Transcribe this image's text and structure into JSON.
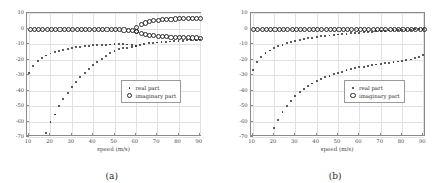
{
  "figure": {
    "panels": [
      {
        "caption": "(a)",
        "legend": {
          "real": "real part",
          "imaginary": "imaginary part"
        },
        "chart_data": {
          "type": "scatter",
          "title": "",
          "xlabel": "speed (m/s)",
          "ylabel": "",
          "xlim": [
            9,
            91
          ],
          "ylim": [
            -70,
            10
          ],
          "xticks": [
            10,
            20,
            30,
            40,
            50,
            60,
            70,
            80,
            90
          ],
          "yticks": [
            10,
            0,
            -10,
            -20,
            -30,
            -40,
            -50,
            -60,
            -70
          ],
          "grid": true,
          "legend_position": "center-right",
          "series": [
            {
              "name": "real part",
              "marker": "filled-dot",
              "x": [
                10,
                12,
                14,
                16,
                18,
                20,
                22,
                24,
                26,
                28,
                30,
                32,
                34,
                36,
                38,
                40,
                42,
                44,
                46,
                48,
                50,
                52,
                54,
                56,
                58,
                60,
                62,
                64,
                66,
                68,
                70,
                72,
                74,
                76,
                78,
                80,
                82,
                84,
                86,
                88,
                90
              ],
              "y": [
                -28.5,
                -24.0,
                -21.0,
                -19.0,
                -17.4,
                -16.1,
                -15.1,
                -14.3,
                -13.6,
                -13.0,
                -12.5,
                -12.1,
                -11.7,
                -11.4,
                -11.1,
                -10.9,
                -10.7,
                -10.5,
                -10.4,
                -10.3,
                -10.2,
                -10.2,
                -10.2,
                -10.3,
                -10.6,
                -11.2,
                -10.6,
                -10.0,
                -9.6,
                -9.3,
                -9.0,
                -8.8,
                -8.6,
                -8.4,
                -8.2,
                -8.1,
                -7.9,
                -7.7,
                -7.5,
                -7.3,
                -7.1
              ]
            },
            {
              "name": "real part branch 2",
              "marker": "filled-dot",
              "x": [
                18,
                20,
                22,
                24,
                26,
                28,
                30,
                32,
                34,
                36,
                38,
                40,
                42,
                44,
                46,
                48,
                50,
                52,
                54,
                56,
                58,
                60
              ],
              "y": [
                -67.5,
                -60.5,
                -55.5,
                -50.0,
                -45.5,
                -41.5,
                -38.0,
                -34.5,
                -31.5,
                -28.5,
                -26.0,
                -23.5,
                -21.5,
                -19.5,
                -17.5,
                -16.0,
                -14.5,
                -13.5,
                -12.8,
                -12.3,
                -11.8,
                -11.4
              ]
            },
            {
              "name": "imaginary part",
              "marker": "open-circle",
              "x": [
                10,
                12,
                14,
                16,
                18,
                20,
                22,
                24,
                26,
                28,
                30,
                32,
                34,
                36,
                38,
                40,
                42,
                44,
                46,
                48,
                50,
                52,
                54,
                56,
                58,
                60
              ],
              "y": [
                -0.2,
                -0.2,
                -0.2,
                -0.2,
                -0.2,
                -0.2,
                -0.2,
                -0.2,
                -0.2,
                -0.2,
                -0.2,
                -0.2,
                -0.2,
                -0.2,
                -0.2,
                -0.2,
                -0.2,
                -0.2,
                -0.2,
                -0.2,
                -0.2,
                -0.2,
                -0.3,
                -0.4,
                -0.6,
                -1.0
              ]
            },
            {
              "name": "imaginary part upper branch",
              "marker": "open-circle",
              "x": [
                60,
                62,
                64,
                66,
                68,
                70,
                72,
                74,
                76,
                78,
                80,
                82,
                84,
                86,
                88,
                90
              ],
              "y": [
                1.0,
                3.0,
                4.2,
                5.0,
                5.6,
                6.0,
                6.3,
                6.5,
                6.7,
                6.8,
                6.9,
                7.0,
                7.1,
                7.1,
                7.2,
                7.2
              ]
            },
            {
              "name": "imaginary part lower branch",
              "marker": "open-circle",
              "x": [
                60,
                62,
                64,
                66,
                68,
                70,
                72,
                74,
                76,
                78,
                80,
                82,
                84,
                86,
                88,
                90
              ],
              "y": [
                -1.2,
                -2.6,
                -3.3,
                -3.8,
                -4.1,
                -4.4,
                -4.6,
                -4.8,
                -5.0,
                -5.1,
                -5.2,
                -5.3,
                -5.4,
                -5.5,
                -5.5,
                -5.6
              ]
            }
          ]
        }
      },
      {
        "caption": "(b)",
        "legend": {
          "real": "real part",
          "imaginary": "imaginary part"
        },
        "chart_data": {
          "type": "scatter",
          "title": "",
          "xlabel": "speed (m/s)",
          "ylabel": "",
          "xlim": [
            9,
            91
          ],
          "ylim": [
            -70,
            10
          ],
          "xticks": [
            10,
            20,
            30,
            40,
            50,
            60,
            70,
            80,
            90
          ],
          "yticks": [
            10,
            0,
            -10,
            -20,
            -30,
            -40,
            -50,
            -60,
            -70
          ],
          "grid": true,
          "legend_position": "center-right",
          "series": [
            {
              "name": "real part",
              "marker": "filled-dot",
              "x": [
                10,
                12,
                14,
                16,
                18,
                20,
                22,
                24,
                26,
                28,
                30,
                32,
                34,
                36,
                38,
                40,
                42,
                44,
                46,
                48,
                50,
                52,
                54,
                56,
                58,
                60,
                62,
                64,
                66,
                68,
                70,
                72,
                74,
                76,
                78,
                80,
                82,
                84,
                86,
                88,
                90
              ],
              "y": [
                -26.5,
                -21.5,
                -18.5,
                -16.0,
                -14.2,
                -12.7,
                -11.4,
                -10.4,
                -9.5,
                -8.7,
                -8.0,
                -7.4,
                -6.8,
                -6.3,
                -5.9,
                -5.5,
                -5.1,
                -4.8,
                -4.5,
                -4.2,
                -3.9,
                -3.6,
                -3.4,
                -3.1,
                -2.9,
                -2.7,
                -2.4,
                -2.2,
                -2.0,
                -1.8,
                -1.6,
                -1.5,
                -1.3,
                -1.2,
                -1.0,
                -0.9,
                -0.8,
                -0.7,
                -0.6,
                -0.5,
                -0.4
              ]
            },
            {
              "name": "real part branch 2",
              "marker": "filled-dot",
              "x": [
                20,
                22,
                24,
                26,
                28,
                30,
                32,
                34,
                36,
                38,
                40,
                42,
                44,
                46,
                48,
                50,
                52,
                54,
                56,
                58,
                60,
                62,
                64,
                66,
                68,
                70,
                72,
                74,
                76,
                78,
                80,
                82,
                84,
                86,
                88,
                90
              ],
              "y": [
                -64.0,
                -59.0,
                -54.0,
                -50.0,
                -46.5,
                -43.5,
                -41.0,
                -39.0,
                -37.0,
                -35.5,
                -34.0,
                -32.5,
                -31.5,
                -30.5,
                -29.5,
                -28.5,
                -27.8,
                -27.0,
                -26.3,
                -25.7,
                -25.1,
                -24.6,
                -24.1,
                -23.6,
                -23.2,
                -22.8,
                -22.4,
                -22.0,
                -21.7,
                -21.3,
                -21.0,
                -20.5,
                -20.0,
                -19.3,
                -18.4,
                -17.2
              ]
            },
            {
              "name": "imaginary part",
              "marker": "open-circle",
              "x": [
                10,
                12,
                14,
                16,
                18,
                20,
                22,
                24,
                26,
                28,
                30,
                32,
                34,
                36,
                38,
                40,
                42,
                44,
                46,
                48,
                50,
                52,
                54,
                56,
                58,
                60,
                62,
                64,
                66,
                68,
                70,
                72,
                74,
                76,
                78,
                80,
                82,
                84,
                86,
                88,
                90
              ],
              "y": [
                -0.2,
                -0.2,
                -0.2,
                -0.2,
                -0.2,
                -0.2,
                -0.2,
                -0.2,
                -0.2,
                -0.2,
                -0.2,
                -0.2,
                -0.2,
                -0.2,
                -0.2,
                -0.2,
                -0.2,
                -0.2,
                -0.2,
                -0.2,
                -0.2,
                -0.2,
                -0.2,
                -0.2,
                -0.2,
                -0.2,
                -0.2,
                -0.2,
                -0.2,
                -0.2,
                -0.2,
                -0.2,
                -0.2,
                -0.2,
                -0.2,
                -0.2,
                -0.2,
                -0.2,
                -0.2,
                -0.2,
                -0.2
              ]
            }
          ]
        }
      }
    ]
  }
}
